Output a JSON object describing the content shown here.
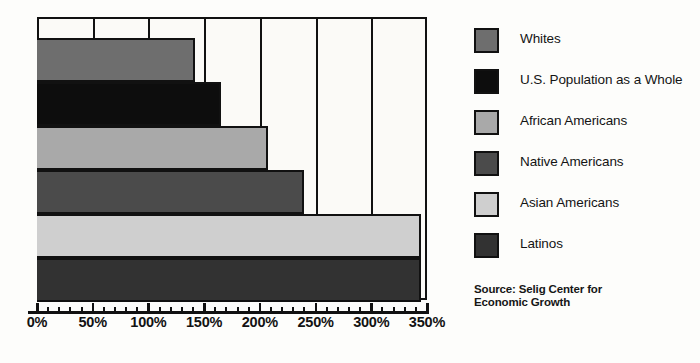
{
  "chart_data": {
    "type": "bar",
    "orientation": "horizontal",
    "title": "",
    "xlabel": "",
    "ylabel": "",
    "xlim": [
      0,
      350
    ],
    "grid": true,
    "grid_interval": 50,
    "legend_position": "right",
    "tick_labels": [
      "0%",
      "50%",
      "100%",
      "150%",
      "200%",
      "250%",
      "300%",
      "350%"
    ],
    "tick_values": [
      0,
      50,
      100,
      150,
      200,
      250,
      300,
      350
    ],
    "minor_tick_interval": 10,
    "categories": [
      "Whites",
      "U.S. Population as a Whole",
      "African Americans",
      "Native Americans",
      "Asian Americans",
      "Latinos"
    ],
    "values": [
      142,
      165,
      207,
      240,
      345,
      345
    ],
    "colors": [
      "#6e6e6e",
      "#0d0d0d",
      "#a9a9a9",
      "#4b4b4b",
      "#cfcfcf",
      "#323232"
    ],
    "source": "Source: Selig Center for Economic Growth"
  },
  "legend": {
    "items": [
      {
        "label": "Whites",
        "color": "#6e6e6e"
      },
      {
        "label": "U.S. Population as a Whole",
        "color": "#0d0d0d"
      },
      {
        "label": "African Americans",
        "color": "#a9a9a9"
      },
      {
        "label": "Native Americans",
        "color": "#4b4b4b"
      },
      {
        "label": "Asian Americans",
        "color": "#cfcfcf"
      },
      {
        "label": "Latinos",
        "color": "#323232"
      }
    ]
  },
  "source_note": {
    "line1": "Source: Selig Center for",
    "line2": "Economic Growth"
  }
}
